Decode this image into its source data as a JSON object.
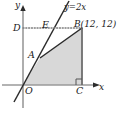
{
  "figure": {
    "type": "geometry-diagram",
    "axes": {
      "x_label": "x",
      "y_label": "y",
      "origin_label": "O"
    },
    "line_equation": "y=2x",
    "points": {
      "A": "A",
      "B": "B(12, 12)",
      "C": "C",
      "D": "D",
      "E": "E"
    },
    "colors": {
      "shade": "#d8d8d8",
      "axis": "#9a9a9a",
      "stroke": "#2b2b2b",
      "dotted": "#7d7d7d"
    }
  }
}
